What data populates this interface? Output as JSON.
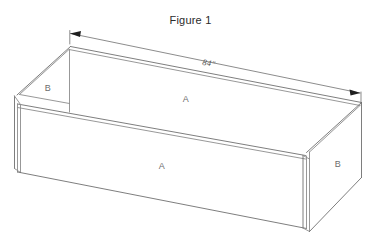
{
  "figure": {
    "title": "Figure 1",
    "kind": "isometric-line-drawing"
  },
  "dimension": {
    "label": "84\"",
    "value": 84,
    "unit": "inch",
    "style": "double-arrow-leader",
    "measures": "back top long edge"
  },
  "panel_labels": {
    "back_inner_long": "A",
    "front_long": "A",
    "left_inner_end": "B",
    "right_end": "B"
  },
  "colors": {
    "background": "#ffffff",
    "line": "#8c8c8c",
    "line_dark": "#6f6f6f",
    "text": "#6d6d6d",
    "title_text": "#2b2b2b",
    "dim_text": "#545454",
    "arrow_fill": "#1f1f1f"
  }
}
